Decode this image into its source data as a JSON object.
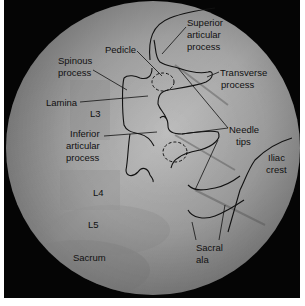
{
  "figure": {
    "type": "fluoroscopy-annotated",
    "view": "oblique lumbar spine",
    "colors": {
      "frame": "#050505",
      "field_light": "#b9b9b9",
      "field_dark": "#6f6f6f",
      "outline": "#111111"
    }
  },
  "labels": {
    "superior_articular_process": [
      "Superior",
      "articular",
      "process"
    ],
    "pedicle": "Pedicle",
    "spinous_process": [
      "Spinous",
      "process"
    ],
    "transverse_process": [
      "Transverse",
      "process"
    ],
    "lamina": "Lamina",
    "l3": "L3",
    "inferior_articular_process": [
      "Inferior",
      "articular",
      "process"
    ],
    "needle_tips": [
      "Needle",
      "tips"
    ],
    "iliac_crest": [
      "Iliac",
      "crest"
    ],
    "l4": "L4",
    "l5": "L5",
    "sacrum": "Sacrum",
    "sacral_ala": [
      "Sacral",
      "ala"
    ]
  }
}
